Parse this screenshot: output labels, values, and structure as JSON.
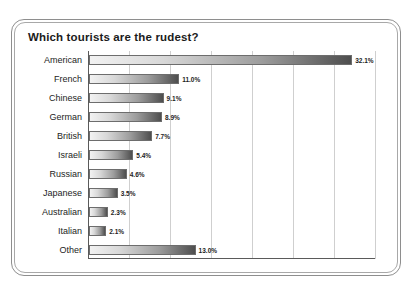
{
  "chart_data": {
    "type": "bar",
    "orientation": "horizontal",
    "title": "Which tourists are the rudest?",
    "xlabel": "",
    "ylabel": "",
    "xlim": [
      0,
      35
    ],
    "grid": true,
    "gridlines": [
      5,
      10,
      15,
      20,
      25,
      30,
      35
    ],
    "legend": "none",
    "value_suffix": "%",
    "categories": [
      "American",
      "French",
      "Chinese",
      "German",
      "British",
      "Israeli",
      "Russian",
      "Japanese",
      "Australian",
      "Italian",
      "Other"
    ],
    "values": [
      32.1,
      11.0,
      9.1,
      8.9,
      7.7,
      5.4,
      4.6,
      3.5,
      2.3,
      2.1,
      13.0
    ],
    "value_labels": [
      "32.1%",
      "11.0%",
      "9.1%",
      "8.9%",
      "7.7%",
      "5.4%",
      "4.6%",
      "3.5%",
      "2.3%",
      "2.1%",
      "13.0%"
    ]
  },
  "style": {
    "bar_gradient_start": "#f2f2f2",
    "bar_gradient_end": "#4e4e4e",
    "bar_border": "#6d6d6d",
    "gridline_color": "#cfcfcf",
    "axis_color": "#5a5a5a",
    "frame_color": "#8e8e8e",
    "background": "#ffffff",
    "text_color": "#1d1d1d"
  }
}
